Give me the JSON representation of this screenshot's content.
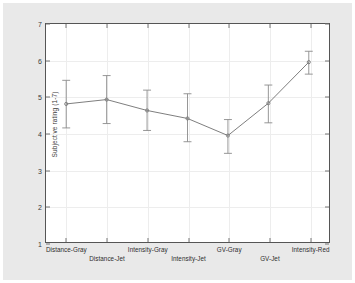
{
  "chart_data": {
    "type": "line",
    "title": "",
    "xlabel": "",
    "ylabel": "Subjective rating (1-7)",
    "ylim": [
      1,
      7
    ],
    "yticks": [
      1,
      2,
      3,
      4,
      5,
      6,
      7
    ],
    "ytick_labels": [
      "1",
      "2",
      "3",
      "4",
      "5",
      "6",
      "7"
    ],
    "grid": true,
    "legend": "none",
    "categories": [
      "Distance-Gray",
      "Distance-Jet",
      "Intensity-Gray",
      "Intensity-Jet",
      "GV-Gray",
      "GV-Jet",
      "Intensity-Red"
    ],
    "values": [
      4.8,
      4.92,
      4.62,
      4.4,
      3.93,
      4.82,
      5.95
    ],
    "error_upper": [
      5.45,
      5.58,
      5.18,
      5.08,
      4.37,
      5.32,
      6.25
    ],
    "error_lower": [
      4.14,
      4.26,
      4.07,
      3.76,
      3.44,
      4.28,
      5.62
    ],
    "line_color": "#6e6e6e",
    "marker_color": "#6e6e6e",
    "error_color": "#8a8a8a",
    "axis_color": "#555555",
    "grid_color": "#ededed",
    "background_color": "#e9e9e9",
    "plot_background_color": "#ffffff"
  }
}
